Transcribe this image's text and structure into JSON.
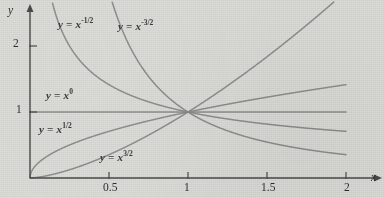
{
  "chart_data": {
    "type": "line",
    "title": "",
    "xlabel": "x",
    "ylabel": "y",
    "xlim": [
      0,
      2.1
    ],
    "ylim": [
      0,
      2.55
    ],
    "xticks": [
      "0.5",
      "1",
      "1.5",
      "2"
    ],
    "xtick_values": [
      0.5,
      1,
      1.5,
      2
    ],
    "yticks": [
      "1",
      "2"
    ],
    "ytick_values": [
      1,
      2
    ],
    "grid": false,
    "legend_position": "inline-annotations",
    "curve_color": "#8a8a8a",
    "axis_color": "#4a4a4a",
    "background_color": "#dcdcd8",
    "series": [
      {
        "name": "y = x^-3/2",
        "exponent": -1.5,
        "label": "y = x",
        "exponent_text": "-3/2",
        "label_x": 118,
        "label_y": 18
      },
      {
        "name": "y = x^-1/2",
        "exponent": -0.5,
        "label": "y = x",
        "exponent_text": "-1/2",
        "label_x": 58,
        "label_y": 16
      },
      {
        "name": "y = x^0",
        "exponent": 0,
        "label": "y = x",
        "exponent_text": "0",
        "label_x": 46,
        "label_y": 88
      },
      {
        "name": "y = x^1/2",
        "exponent": 0.5,
        "label": "y = x",
        "exponent_text": "1/2",
        "label_x": 39,
        "label_y": 122
      },
      {
        "name": "y = x^3/2",
        "exponent": 1.5,
        "label": "y = x",
        "exponent_text": "3/2",
        "label_x": 100,
        "label_y": 150
      }
    ],
    "intersection_point": [
      1,
      1
    ],
    "annotations": [
      {
        "text": "y = x",
        "sup": "-1/2"
      },
      {
        "text": "y = x",
        "sup": "-3/2"
      },
      {
        "text": "y = x",
        "sup": "0"
      },
      {
        "text": "y = x",
        "sup": "1/2"
      },
      {
        "text": "y = x",
        "sup": "3/2"
      }
    ]
  },
  "axes": {
    "x_name": "x",
    "y_name": "y",
    "x_tick_labels": [
      "0.5",
      "1",
      "1.5",
      "2"
    ],
    "y_tick_labels": [
      "2",
      "1"
    ]
  }
}
